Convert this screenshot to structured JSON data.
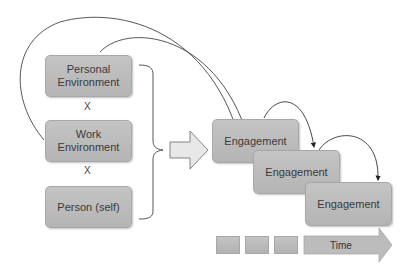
{
  "diagram": {
    "inputs": [
      {
        "label_line1": "Personal",
        "label_line2": "Environment"
      },
      {
        "label_line1": "Work",
        "label_line2": "Environment"
      },
      {
        "label_line1": "Person (self)"
      }
    ],
    "operators": [
      "X",
      "X"
    ],
    "engagements": [
      {
        "label": "Engagement"
      },
      {
        "label": "Engagement"
      },
      {
        "label": "Engagement"
      }
    ],
    "timeline": {
      "label": "Time",
      "segments": 3
    },
    "colors": {
      "box_fill": "#bdbdbd",
      "line": "#333333",
      "block_arrow_fill": "#e6e6e6"
    }
  }
}
